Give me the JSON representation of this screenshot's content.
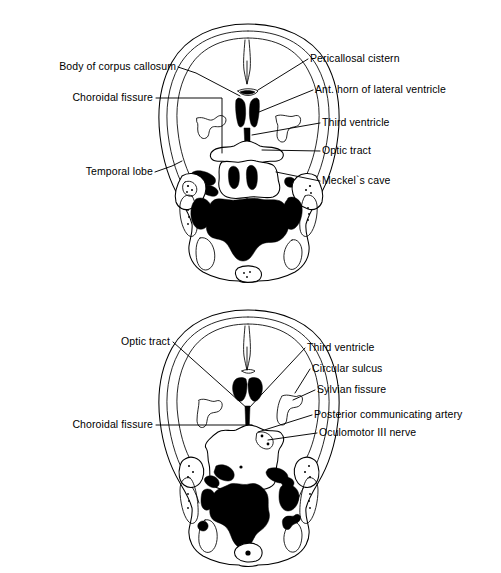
{
  "figure": {
    "background_color": "#ffffff",
    "line_color": "#000000",
    "fill_color": "#000000",
    "panel_count": 2
  },
  "panels": [
    {
      "id": "upper-section",
      "name": "Upper axial section",
      "labels_left": [
        {
          "id": "body-of-corpus-callosum",
          "text": "Body of corpus callosum",
          "x": 176,
          "y": 70
        },
        {
          "id": "choroidal-fissure-top",
          "text": "Choroidal fissure",
          "x": 153,
          "y": 101
        },
        {
          "id": "temporal-lobe",
          "text": "Temporal lobe",
          "x": 153,
          "y": 175
        }
      ],
      "labels_right": [
        {
          "id": "pericallosal-cistern",
          "text": "Pericallosal cistern",
          "x": 310,
          "y": 62
        },
        {
          "id": "ant-horn-of-lateral-ventricle",
          "text": "Ant. horn of lateral ventricle",
          "x": 315,
          "y": 93
        },
        {
          "id": "third-ventricle-top",
          "text": "Third ventricle",
          "x": 322,
          "y": 126
        },
        {
          "id": "optic-tract-top",
          "text": "Optic tract",
          "x": 322,
          "y": 154
        },
        {
          "id": "meckels-cave",
          "text": "Meckel`s cave",
          "x": 322,
          "y": 184
        }
      ]
    },
    {
      "id": "lower-section",
      "name": "Lower axial section",
      "labels_left": [
        {
          "id": "optic-tract-bottom",
          "text": "Optic tract",
          "x": 170,
          "y": 345
        },
        {
          "id": "choroidal-fissure-bottom",
          "text": "Choroidal fissure",
          "x": 153,
          "y": 428
        }
      ],
      "labels_right": [
        {
          "id": "third-ventricle-bottom",
          "text": "Third ventricle",
          "x": 307,
          "y": 351
        },
        {
          "id": "circular-sulcus",
          "text": "Circular sulcus",
          "x": 312,
          "y": 372
        },
        {
          "id": "sylvian-fissure",
          "text": "Sylvian fissure",
          "x": 317,
          "y": 393
        },
        {
          "id": "posterior-communicating-artery",
          "text": "Posterior communicating artery",
          "x": 314,
          "y": 418
        },
        {
          "id": "oculomotor-iii-nerve",
          "text": "Oculomotor III nerve",
          "x": 319,
          "y": 436
        }
      ]
    }
  ]
}
